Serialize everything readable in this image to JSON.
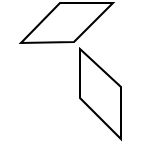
{
  "figure": {
    "width": 152,
    "height": 164,
    "background": "#ffffff",
    "stroke_color": "#000000",
    "stroke_width": 2,
    "shapes": [
      {
        "name": "top-parallelogram",
        "type": "polygon",
        "points": "60,3 113,3 74,42 21,43"
      },
      {
        "name": "bottom-parallelogram",
        "type": "polygon",
        "points": "80,49 121,87 121,139 80,98"
      }
    ]
  }
}
